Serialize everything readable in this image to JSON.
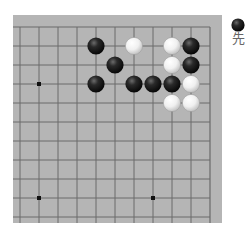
{
  "board": {
    "board_color": "#b5b5b5",
    "line_color": "#6a6a6a",
    "grid": {
      "columns_visible": 11,
      "rows_visible": 11,
      "spacing_px": 19,
      "origin_x": 7,
      "origin_y": 12,
      "edges_shown": [
        "top",
        "right"
      ]
    },
    "star_points": [
      {
        "col": 1,
        "row": 3
      },
      {
        "col": 1,
        "row": 9
      },
      {
        "col": 7,
        "row": 9
      }
    ],
    "stones": [
      {
        "color": "black",
        "col": 4,
        "row": 1
      },
      {
        "color": "white",
        "col": 6,
        "row": 1
      },
      {
        "color": "white",
        "col": 8,
        "row": 1
      },
      {
        "color": "black",
        "col": 9,
        "row": 1
      },
      {
        "color": "black",
        "col": 5,
        "row": 2
      },
      {
        "color": "white",
        "col": 8,
        "row": 2
      },
      {
        "color": "black",
        "col": 9,
        "row": 2
      },
      {
        "color": "black",
        "col": 4,
        "row": 3
      },
      {
        "color": "black",
        "col": 6,
        "row": 3
      },
      {
        "color": "black",
        "col": 7,
        "row": 3
      },
      {
        "color": "black",
        "col": 8,
        "row": 3
      },
      {
        "color": "white",
        "col": 9,
        "row": 3
      },
      {
        "color": "white",
        "col": 8,
        "row": 4
      },
      {
        "color": "white",
        "col": 9,
        "row": 4
      }
    ]
  },
  "to_move": {
    "stone_color": "black",
    "label": "先"
  }
}
